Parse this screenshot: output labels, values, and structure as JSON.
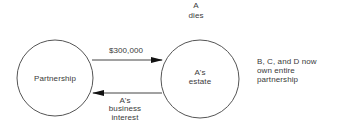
{
  "diagram": {
    "title_event": {
      "line1": "A",
      "line2": "dies"
    },
    "nodes": [
      {
        "id": "partnership",
        "label": "Partnership",
        "cx": 55,
        "cy": 78,
        "r": 38
      },
      {
        "id": "estate",
        "label_line1": "A's",
        "label_line2": "estate",
        "cx": 200,
        "cy": 79,
        "r": 39
      }
    ],
    "edges": [
      {
        "from": "partnership",
        "to": "estate",
        "label": "$300,000",
        "y": 60,
        "x1": 92,
        "x2": 162
      },
      {
        "from": "estate",
        "to": "partnership",
        "label_line1": "A's",
        "label_line2": "business",
        "label_line3": "interest",
        "y": 93,
        "x1": 162,
        "x2": 93
      }
    ],
    "note": {
      "line1": "B, C, and D now",
      "line2": "own entire",
      "line3": "partnership"
    },
    "colors": {
      "stroke": "#555555",
      "arrow": "#111111",
      "text": "#3a3a3a",
      "background": "#ffffff"
    }
  }
}
